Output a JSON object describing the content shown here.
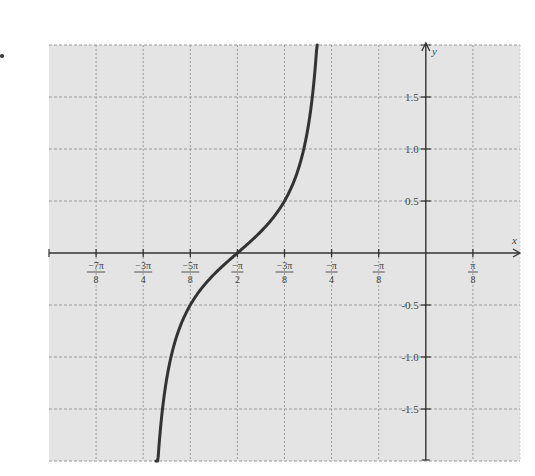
{
  "chart_data": {
    "type": "line",
    "title": "",
    "function": "y = (1/2)·tan(2x) (curve through (-π/2, 0))",
    "xlabel": "x",
    "ylabel": "y",
    "xlim": [
      -3.14159,
      0.7854
    ],
    "ylim": [
      -2.0,
      2.0
    ],
    "grid": true,
    "legend": null,
    "x_ticks": [
      {
        "value": -2.7489,
        "num": "−7π",
        "den": "8"
      },
      {
        "value": -2.3562,
        "num": "−3π",
        "den": "4"
      },
      {
        "value": -1.9635,
        "num": "−5π",
        "den": "8"
      },
      {
        "value": -1.5708,
        "num": "−π",
        "den": "2"
      },
      {
        "value": -1.1781,
        "num": "−3π",
        "den": "8"
      },
      {
        "value": -0.7854,
        "num": "−π",
        "den": "4"
      },
      {
        "value": -0.3927,
        "num": "−π",
        "den": "8"
      },
      {
        "value": 0.3927,
        "num": "π",
        "den": "8"
      }
    ],
    "y_ticks": [
      {
        "value": 1.5,
        "label": "1.5"
      },
      {
        "value": 1.0,
        "label": "1.0"
      },
      {
        "value": 0.5,
        "label": "0.5"
      },
      {
        "value": -0.5,
        "label": "-0.5"
      },
      {
        "value": -1.0,
        "label": "-1.0"
      },
      {
        "value": -1.5,
        "label": "-1.5"
      }
    ],
    "series": [
      {
        "name": "curve",
        "x_range": [
          -2.25,
          -0.905
        ],
        "points": [
          {
            "x": -2.25,
            "y": -2.0
          },
          {
            "x": -2.12,
            "y": -1.5
          },
          {
            "x": -2.06,
            "y": -1.0
          },
          {
            "x": -1.96,
            "y": -0.5
          },
          {
            "x": -1.5708,
            "y": 0.0
          },
          {
            "x": -1.1781,
            "y": 0.5
          },
          {
            "x": -1.02,
            "y": 1.0
          },
          {
            "x": -0.95,
            "y": 1.5
          },
          {
            "x": -0.905,
            "y": 1.96
          }
        ]
      }
    ]
  },
  "colors": {
    "plot_background": "#e4e4e4",
    "grid": "#9a9a9a",
    "axis": "#333333",
    "curve": "#333333",
    "label": "#444444"
  }
}
